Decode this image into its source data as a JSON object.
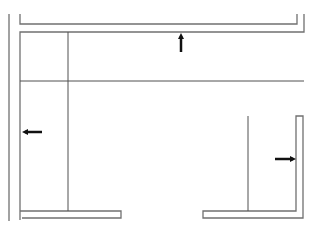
{
  "diagram": {
    "type": "floor-plan",
    "width": 317,
    "height": 228,
    "colors": {
      "background": "#ffffff",
      "wall": "#707070",
      "divider": "#505050",
      "arrow": "#111111"
    },
    "walls": [
      {
        "name": "outer-left-wall",
        "points": "9,14 9,221"
      },
      {
        "name": "inner-left-wall",
        "points": "20,14 20,24 297,24 297,14"
      },
      {
        "name": "top-inner-wall",
        "points": "20,220 20,32 304,32 304,14"
      },
      {
        "name": "bottom-left-wall",
        "points": "20,211 121,211 121,218 22,218"
      },
      {
        "name": "bottom-right-wall",
        "points": "248,211 203,211 203,218 303,218 303,116 296,116 296,211 248,211"
      }
    ],
    "dividers": [
      {
        "name": "left-room-divider",
        "x1": 68,
        "y1": 32,
        "x2": 68,
        "y2": 211
      },
      {
        "name": "middle-horizontal-divider",
        "x1": 20,
        "y1": 81,
        "x2": 304,
        "y2": 81
      },
      {
        "name": "right-room-divider",
        "x1": 248,
        "y1": 116,
        "x2": 248,
        "y2": 211
      }
    ],
    "arrows": [
      {
        "name": "arrow-up",
        "direction": "up",
        "x": 181,
        "y1": 52,
        "y2": 33
      },
      {
        "name": "arrow-left",
        "direction": "left",
        "y": 132,
        "x1": 42,
        "x2": 22
      },
      {
        "name": "arrow-right",
        "direction": "right",
        "y": 159,
        "x1": 275,
        "x2": 296
      }
    ]
  }
}
